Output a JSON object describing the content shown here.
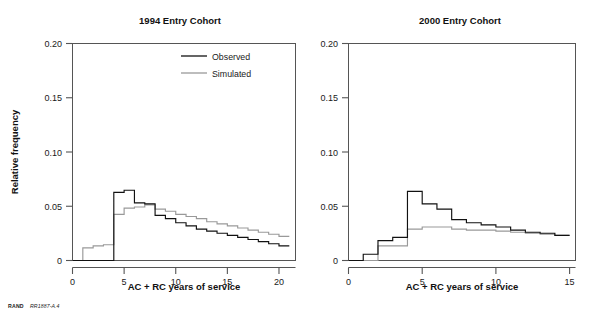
{
  "figure": {
    "credit_org": "RAND",
    "credit_id": "RR1887-A.4",
    "background": "#ffffff"
  },
  "colors": {
    "observed": "#111111",
    "simulated": "#999999",
    "axis": "#555555",
    "text": "#1a1a1a"
  },
  "legend": {
    "position": "top-center-left-panel",
    "entries": [
      {
        "label": "Observed",
        "color": "#111111"
      },
      {
        "label": "Simulated",
        "color": "#999999"
      }
    ]
  },
  "chart_data": [
    {
      "type": "line",
      "panel": "left",
      "title": "1994 Entry Cohort",
      "xlabel": "AC + RC years of service",
      "ylabel": "Relative frequency",
      "grid": false,
      "xlim": [
        0,
        21.6
      ],
      "ylim": [
        0,
        0.207
      ],
      "xticks": [
        0,
        5,
        10,
        15,
        20
      ],
      "xticklabels": [
        "0",
        "5",
        "10",
        "15",
        "20"
      ],
      "yticks": [
        0,
        0.05,
        0.1,
        0.15,
        0.2
      ],
      "yticklabels": [
        "0",
        "0.05",
        "0.10",
        "0.15",
        "0.20"
      ],
      "step_edges": [
        0,
        1,
        2,
        3,
        4,
        5,
        6,
        7,
        8,
        9,
        10,
        11,
        12,
        13,
        14,
        15,
        16,
        17,
        18,
        19,
        20,
        21
      ],
      "series": [
        {
          "name": "Observed",
          "color": "#111111",
          "values": [
            0.0,
            0.0,
            0.0,
            0.0,
            0.065,
            0.067,
            0.055,
            0.054,
            0.043,
            0.04,
            0.036,
            0.033,
            0.03,
            0.028,
            0.026,
            0.024,
            0.022,
            0.02,
            0.018,
            0.016,
            0.014
          ]
        },
        {
          "name": "Simulated",
          "color": "#999999",
          "values": [
            0.0,
            0.012,
            0.014,
            0.015,
            0.044,
            0.05,
            0.051,
            0.053,
            0.049,
            0.047,
            0.044,
            0.042,
            0.04,
            0.037,
            0.035,
            0.033,
            0.031,
            0.029,
            0.027,
            0.025,
            0.023
          ]
        }
      ]
    },
    {
      "type": "line",
      "panel": "right",
      "title": "2000 Entry Cohort",
      "xlabel": "AC + RC years of service",
      "ylabel": "Relative frequency",
      "grid": false,
      "xlim": [
        0,
        15.4
      ],
      "ylim": [
        0,
        0.207
      ],
      "xticks": [
        0,
        5,
        10,
        15
      ],
      "xticklabels": [
        "0",
        "5",
        "10",
        "15"
      ],
      "yticks": [
        0,
        0.05,
        0.1,
        0.15,
        0.2
      ],
      "yticklabels": [
        "0",
        "0.05",
        "0.10",
        "0.15",
        "0.20"
      ],
      "step_edges": [
        0,
        1,
        2,
        3,
        4,
        5,
        6,
        7,
        8,
        9,
        10,
        11,
        12,
        13,
        14,
        15
      ],
      "series": [
        {
          "name": "Observed",
          "color": "#111111",
          "values": [
            0.0,
            0.006,
            0.019,
            0.022,
            0.066,
            0.054,
            0.049,
            0.039,
            0.036,
            0.034,
            0.032,
            0.029,
            0.027,
            0.026,
            0.024
          ]
        },
        {
          "name": "Simulated",
          "color": "#999999",
          "values": [
            0.0,
            0.0,
            0.014,
            0.014,
            0.03,
            0.032,
            0.032,
            0.03,
            0.029,
            0.029,
            0.028,
            0.027,
            0.026,
            0.025,
            0.024
          ]
        }
      ]
    }
  ]
}
